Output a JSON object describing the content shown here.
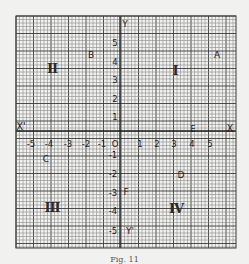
{
  "figure": {
    "caption": "Fig. 11",
    "axes": {
      "x_axis_label_positive": "X",
      "x_axis_label_negative": "X'",
      "y_axis_label_positive": "Y",
      "y_axis_label_negative": "Y'",
      "origin_label": "O",
      "x_ticks": [
        "-5",
        "-4",
        "-3",
        "-2",
        "-1",
        "1",
        "2",
        "3",
        "4",
        "5"
      ],
      "y_ticks": [
        "5",
        "4",
        "3",
        "2",
        "1",
        "-1",
        "-2",
        "-3",
        "-4",
        "-5"
      ]
    },
    "quadrants": [
      {
        "id": "I",
        "label": "I"
      },
      {
        "id": "II",
        "label": "II"
      },
      {
        "id": "III",
        "label": "III"
      },
      {
        "id": "IV",
        "label": "IV"
      }
    ],
    "points": [
      {
        "name": "A",
        "x": 5.5,
        "y": 4.5
      },
      {
        "name": "B",
        "x": -1.5,
        "y": 4.5
      },
      {
        "name": "C",
        "x": -4,
        "y": -1
      },
      {
        "name": "D",
        "x": 3.5,
        "y": -2
      },
      {
        "name": "E",
        "x": 4,
        "y": 0
      },
      {
        "name": "F",
        "x": 0,
        "y": -3
      }
    ],
    "colors": {
      "paper": "#f1f1ef",
      "grid_minor": "#8a8a8a",
      "grid_major": "#3a3a3a",
      "axis": "#1a1a1a",
      "text": "#1e1e1e"
    }
  }
}
